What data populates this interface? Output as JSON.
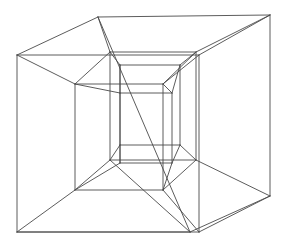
{
  "figure": {
    "projection": "Schlegel diagram / central perspective projection",
    "render_style": "line drawing",
    "background_color": "#ffffff",
    "line_color": "#4a4a4a",
    "line_width": 0.9,
    "canvas": {
      "width": 284,
      "height": 246
    },
    "text_labels": [],
    "cubes": [
      {
        "name": "outer-cube",
        "role": "outer cell",
        "front_face": [
          {
            "x": 17,
            "y": 55
          },
          {
            "x": 199,
            "y": 55
          },
          {
            "x": 199,
            "y": 232
          },
          {
            "x": 17,
            "y": 232
          }
        ],
        "back_face": [
          {
            "x": 98,
            "y": 17
          },
          {
            "x": 270,
            "y": 15
          },
          {
            "x": 270,
            "y": 196
          },
          {
            "x": 190,
            "y": 232
          }
        ]
      },
      {
        "name": "middle-cube",
        "role": "intermediate nested cell",
        "front_face": [
          {
            "x": 75,
            "y": 84
          },
          {
            "x": 163,
            "y": 84
          },
          {
            "x": 163,
            "y": 190
          },
          {
            "x": 75,
            "y": 190
          }
        ],
        "back_face": [
          {
            "x": 110,
            "y": 52
          },
          {
            "x": 196,
            "y": 52
          },
          {
            "x": 196,
            "y": 160
          },
          {
            "x": 110,
            "y": 160
          }
        ]
      },
      {
        "name": "inner-cube",
        "role": "inner cell",
        "front_face": [
          {
            "x": 120,
            "y": 93
          },
          {
            "x": 172,
            "y": 93
          },
          {
            "x": 172,
            "y": 163
          },
          {
            "x": 120,
            "y": 163
          }
        ],
        "back_face": [
          {
            "x": 120,
            "y": 65
          },
          {
            "x": 180,
            "y": 65
          },
          {
            "x": 180,
            "y": 145
          },
          {
            "x": 120,
            "y": 145
          }
        ]
      }
    ],
    "edge_groups": [
      {
        "name": "outer-cube-edges",
        "color": "#5a5a5a",
        "segments": [
          [
            17,
            55,
            199,
            55
          ],
          [
            199,
            55,
            199,
            232
          ],
          [
            199,
            232,
            17,
            232
          ],
          [
            17,
            232,
            17,
            55
          ],
          [
            98,
            17,
            270,
            15
          ],
          [
            270,
            15,
            270,
            196
          ],
          [
            270,
            196,
            190,
            232
          ],
          [
            190,
            232,
            98,
            17
          ],
          [
            17,
            55,
            98,
            17
          ],
          [
            199,
            55,
            270,
            15
          ],
          [
            199,
            232,
            270,
            196
          ],
          [
            17,
            232,
            190,
            232
          ]
        ]
      },
      {
        "name": "outer-to-middle-connectors",
        "color": "#606060",
        "segments": [
          [
            17,
            55,
            75,
            84
          ],
          [
            199,
            55,
            163,
            84
          ],
          [
            199,
            232,
            163,
            190
          ],
          [
            17,
            232,
            75,
            190
          ],
          [
            98,
            17,
            110,
            52
          ],
          [
            270,
            15,
            196,
            52
          ],
          [
            270,
            196,
            196,
            160
          ],
          [
            190,
            232,
            110,
            160
          ]
        ]
      },
      {
        "name": "middle-cube-edges",
        "color": "#555555",
        "segments": [
          [
            75,
            84,
            163,
            84
          ],
          [
            163,
            84,
            163,
            190
          ],
          [
            163,
            190,
            75,
            190
          ],
          [
            75,
            190,
            75,
            84
          ],
          [
            110,
            52,
            196,
            52
          ],
          [
            196,
            52,
            196,
            160
          ],
          [
            196,
            160,
            110,
            160
          ],
          [
            110,
            160,
            110,
            52
          ],
          [
            75,
            84,
            110,
            52
          ],
          [
            163,
            84,
            196,
            52
          ],
          [
            163,
            190,
            196,
            160
          ],
          [
            75,
            190,
            110,
            160
          ]
        ]
      },
      {
        "name": "middle-to-inner-connectors",
        "color": "#606060",
        "segments": [
          [
            75,
            84,
            120,
            93
          ],
          [
            163,
            84,
            172,
            93
          ],
          [
            163,
            190,
            172,
            163
          ],
          [
            75,
            190,
            120,
            163
          ],
          [
            110,
            52,
            120,
            65
          ],
          [
            196,
            52,
            180,
            65
          ],
          [
            196,
            160,
            180,
            145
          ],
          [
            110,
            160,
            120,
            145
          ]
        ]
      },
      {
        "name": "inner-cube-edges",
        "color": "#4f4f4f",
        "segments": [
          [
            120,
            93,
            172,
            93
          ],
          [
            172,
            93,
            172,
            163
          ],
          [
            172,
            163,
            120,
            163
          ],
          [
            120,
            163,
            120,
            93
          ],
          [
            120,
            65,
            180,
            65
          ],
          [
            180,
            65,
            180,
            145
          ],
          [
            180,
            145,
            120,
            145
          ],
          [
            120,
            145,
            120,
            65
          ],
          [
            120,
            93,
            120,
            65
          ],
          [
            172,
            93,
            180,
            65
          ],
          [
            172,
            163,
            180,
            145
          ],
          [
            120,
            163,
            120,
            145
          ]
        ]
      }
    ]
  }
}
